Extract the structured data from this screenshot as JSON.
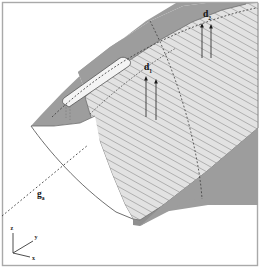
{
  "figure": {
    "background_color": "#ffffff",
    "border_color": "#a8a8a8",
    "surfaces": {
      "upper_shaded_color": "#9e9e9e",
      "lower_shaded_color": "#9e9e9e",
      "hatched_fill_color": "#e0e0e0",
      "hatch_line_color": "#8a8a8a",
      "slot_fill_color": "#f2f2f2",
      "outline_color": "#4a4a4a"
    },
    "annotations": [
      {
        "id": "d1",
        "symbol": "d",
        "subscript": "1",
        "label_x": 149,
        "label_y": 69,
        "leaders": [
          {
            "x": 147,
            "y_top": 77,
            "y_bottom": 116
          },
          {
            "x": 157,
            "y_top": 80,
            "y_bottom": 119
          }
        ]
      },
      {
        "id": "d2",
        "symbol": "d",
        "subscript": "2",
        "label_x": 208,
        "label_y": 18,
        "leaders": [
          {
            "x": 203,
            "y_top": 24,
            "y_bottom": 57
          },
          {
            "x": 211,
            "y_top": 25,
            "y_bottom": 57
          }
        ]
      },
      {
        "id": "ga",
        "symbol": "g",
        "subscript": "a",
        "label_x": 38,
        "label_y": 196,
        "leader_line": {
          "style": "dotted",
          "x1": 2,
          "y1": 216,
          "x2": 88,
          "y2": 145
        }
      }
    ],
    "axes": {
      "origin_x": 13,
      "origin_y": 253,
      "triad": [
        {
          "name": "z",
          "label": "z",
          "dx": 0,
          "dy": -20,
          "label_dx": -1,
          "label_dy": -23
        },
        {
          "name": "y",
          "label": "y",
          "dx": 20,
          "dy": -12,
          "label_dx": 22,
          "label_dy": -14
        },
        {
          "name": "x",
          "label": "x",
          "dx": 17,
          "dy": 4,
          "label_dx": 19,
          "label_dy": 7
        }
      ]
    }
  }
}
